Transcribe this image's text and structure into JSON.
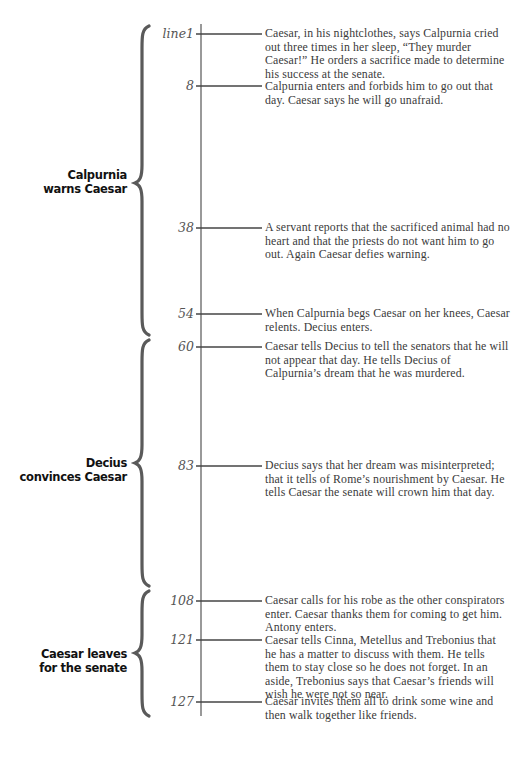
{
  "diagram": {
    "type": "timeline",
    "axis": {
      "x": 201,
      "y_start": 24,
      "y_end": 716,
      "color": "#555555"
    },
    "scenes": [
      {
        "label_line1": "Calpurnia",
        "label_line2": "warns Caesar",
        "brace_top": 26,
        "brace_cusp": 183,
        "brace_bottom": 335
      },
      {
        "label_line1": "Decius",
        "label_line2": "convinces Caesar",
        "brace_top": 340,
        "brace_cusp": 463,
        "brace_bottom": 586
      },
      {
        "label_line1": "Caesar leaves",
        "label_line2": "for the senate",
        "brace_top": 591,
        "brace_cusp": 653,
        "brace_bottom": 716
      }
    ],
    "events": [
      {
        "line": "line1",
        "y": 34,
        "text": "Caesar, in his nightclothes, says Calpurnia cried out three times in her sleep, “They murder Caesar!” He orders a sacrifice made to determine his success at the senate."
      },
      {
        "line": "8",
        "y": 86,
        "text": "Calpurnia enters and forbids him to go out that day. Caesar says he will go unafraid."
      },
      {
        "line": "38",
        "y": 228,
        "text": "A servant reports that the sacrificed animal had no heart and that the priests do not want him to go out. Again Caesar defies warning."
      },
      {
        "line": "54",
        "y": 314,
        "text": "When Calpurnia begs Caesar on her knees, Caesar relents. Decius enters."
      },
      {
        "line": "60",
        "y": 347,
        "text": "Caesar tells Decius to tell the senators that he will not appear that day. He tells Decius of Calpurnia’s dream that he was murdered."
      },
      {
        "line": "83",
        "y": 466,
        "text": "Decius says that her dream was misinterpreted; that it tells of Rome’s nourishment by Caesar. He tells Caesar the senate will crown him that day."
      },
      {
        "line": "108",
        "y": 601,
        "text": "Caesar calls for his robe as the other conspirators enter. Caesar thanks them for coming to get him. Antony enters."
      },
      {
        "line": "121",
        "y": 640,
        "text": "Caesar tells Cinna, Metellus and Trebonius that he has a matter to discuss with them. He tells them to stay close so he does not forget. In an aside, Trebonius says that Caesar’s friends will wish he were not so near."
      },
      {
        "line": "127",
        "y": 702,
        "text": "Caesar invites them all to drink some wine and then walk together like friends."
      }
    ]
  }
}
